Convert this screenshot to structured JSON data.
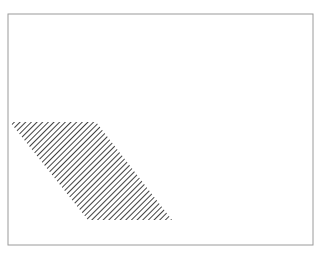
{
  "figure": {
    "title": "",
    "background_color": "#ffffff",
    "canvas": {
      "width": 321,
      "height": 257
    },
    "frame": {
      "name": "figure-border",
      "x": 8,
      "y": 14,
      "width": 305,
      "height": 231,
      "stroke_color": "#9a9a9a",
      "stroke_width": 1,
      "fill": "none"
    },
    "shape": {
      "name": "hatched-parallelogram",
      "type": "parallelogram",
      "fill_style": "diagonal-hatch",
      "hatch_color": "#111111",
      "hatch_angle_deg": 45,
      "hatch_spacing_px": 4,
      "hatch_line_width_px": 1.6,
      "outline": "none",
      "vertices": [
        {
          "x": 10,
          "y": 122
        },
        {
          "x": 96,
          "y": 122
        },
        {
          "x": 172,
          "y": 220
        },
        {
          "x": 88,
          "y": 220
        }
      ],
      "top_edge": {
        "x1": 10,
        "y1": 122,
        "x2": 96,
        "y2": 122
      },
      "bottom_edge": {
        "x1": 88,
        "y1": 220,
        "x2": 172,
        "y2": 220
      },
      "left_edge": {
        "x1": 10,
        "y1": 122,
        "x2": 88,
        "y2": 220
      },
      "right_edge": {
        "x1": 96,
        "y1": 122,
        "x2": 172,
        "y2": 220
      }
    }
  },
  "chart_data": {
    "type": "diagram",
    "title": "",
    "subtitle": "",
    "xlabel": "",
    "ylabel": "",
    "grid": false,
    "legend": null,
    "annotations": [],
    "elements": [
      {
        "id": "border-rectangle",
        "shape": "rectangle",
        "x": 8,
        "y": 14,
        "width": 305,
        "height": 231,
        "fill": "none",
        "stroke": "#9a9a9a"
      },
      {
        "id": "hatched-region",
        "shape": "parallelogram",
        "points": "10,122 96,122 172,220 88,220",
        "fill": "diagonal-hatch",
        "stroke": "none",
        "hatch_color": "#111111",
        "hatch_spacing": 4,
        "hatch_angle": 45
      }
    ]
  }
}
